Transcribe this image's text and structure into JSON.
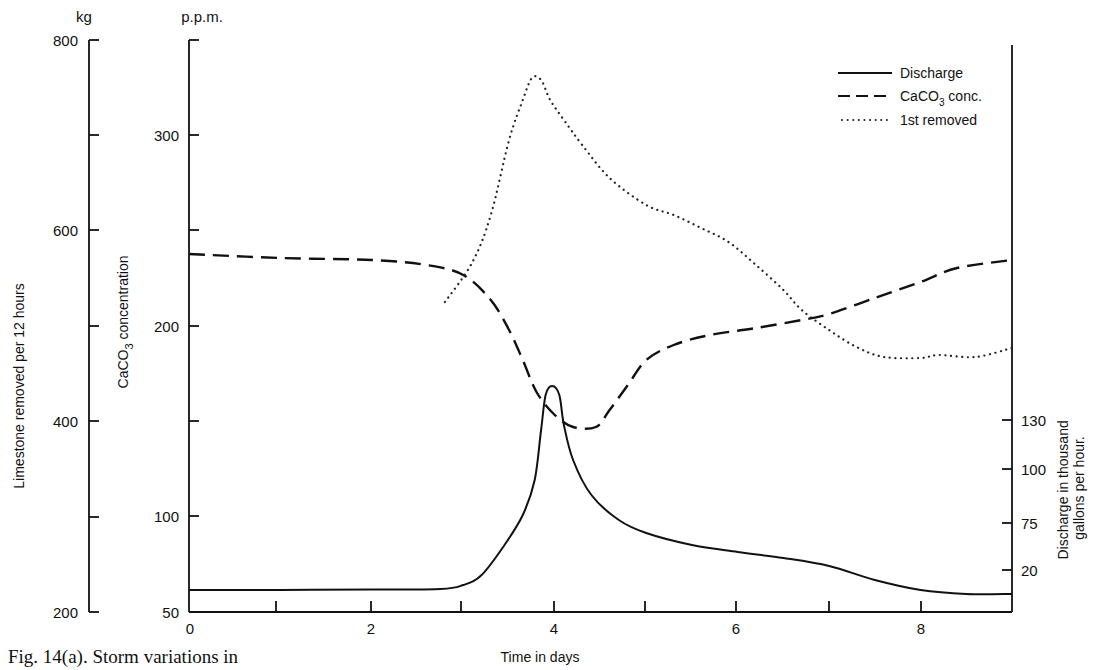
{
  "caption": "Fig. 14(a). Storm variations in",
  "chart_data": {
    "type": "line",
    "title": "",
    "xlabel": "Time in days",
    "x_ticks": [
      0,
      2,
      4,
      6,
      8
    ],
    "x_minor_ticks": [
      1,
      3,
      5,
      7
    ],
    "xlim": [
      0,
      9
    ],
    "axes": {
      "kg": {
        "unit_label": "kg",
        "label": "Limestone removed per 12 hours",
        "ticks": [
          800,
          700,
          600,
          500,
          400,
          300,
          200
        ],
        "tick_labels": [
          "800",
          "",
          "600",
          "",
          "400",
          "",
          "200"
        ],
        "range": [
          200,
          800
        ]
      },
      "ppm": {
        "unit_label": "p.p.m.",
        "label": "CaCO3 concentration",
        "ticks": [
          "top",
          300,
          250,
          200,
          150,
          100,
          50
        ],
        "tick_labels": [
          "",
          "300",
          "",
          "200",
          "",
          "100",
          "50"
        ],
        "range": [
          50,
          350
        ]
      },
      "discharge": {
        "label": "Discharge in thousand gallons per hour.",
        "tick_labels": [
          "130",
          "100",
          "75",
          "20"
        ]
      }
    },
    "legend": [
      {
        "name": "Discharge",
        "style": "solid"
      },
      {
        "name": "CaCO3 conc.",
        "style": "dashed"
      },
      {
        "name": "1st removed",
        "style": "dotted"
      }
    ],
    "legend_position": "top-right",
    "grid": false,
    "series": [
      {
        "name": "Discharge",
        "axis": "discharge",
        "style": "solid",
        "points": [
          [
            0,
            590
          ],
          [
            1,
            590
          ],
          [
            2,
            589.5
          ],
          [
            2.75,
            589
          ],
          [
            3.0,
            585
          ],
          [
            3.2,
            575
          ],
          [
            3.45,
            545
          ],
          [
            3.65,
            515
          ],
          [
            3.78,
            480
          ],
          [
            3.85,
            430
          ],
          [
            3.9,
            395
          ],
          [
            3.97,
            386
          ],
          [
            4.05,
            395
          ],
          [
            4.1,
            425
          ],
          [
            4.2,
            460
          ],
          [
            4.4,
            495
          ],
          [
            4.7,
            520
          ],
          [
            5.0,
            533
          ],
          [
            5.5,
            545
          ],
          [
            6.0,
            552
          ],
          [
            6.5,
            558
          ],
          [
            7.0,
            566
          ],
          [
            7.5,
            580
          ],
          [
            8.0,
            590
          ],
          [
            8.5,
            594
          ],
          [
            9.0,
            594
          ]
        ]
      },
      {
        "name": "CaCO3 conc.",
        "axis": "ppm",
        "style": "dashed",
        "points": [
          [
            0,
            254
          ],
          [
            1,
            258
          ],
          [
            2,
            260
          ],
          [
            2.6,
            265
          ],
          [
            3.0,
            275
          ],
          [
            3.3,
            300
          ],
          [
            3.5,
            330
          ],
          [
            3.65,
            360
          ],
          [
            3.8,
            392
          ],
          [
            4.0,
            415
          ],
          [
            4.2,
            427
          ],
          [
            4.45,
            427
          ],
          [
            4.6,
            410
          ],
          [
            4.8,
            385
          ],
          [
            5.0,
            360
          ],
          [
            5.3,
            345
          ],
          [
            5.7,
            335
          ],
          [
            6.2,
            328
          ],
          [
            6.7,
            320
          ],
          [
            7.0,
            314
          ],
          [
            7.5,
            298
          ],
          [
            8.0,
            282
          ],
          [
            8.4,
            268
          ],
          [
            9.0,
            260
          ]
        ]
      },
      {
        "name": "1st removed",
        "axis": "kg",
        "style": "dotted",
        "points": [
          [
            2.8,
            302
          ],
          [
            3.1,
            262
          ],
          [
            3.3,
            215
          ],
          [
            3.5,
            140
          ],
          [
            3.65,
            100
          ],
          [
            3.75,
            78
          ],
          [
            3.85,
            80
          ],
          [
            3.95,
            100
          ],
          [
            4.1,
            120
          ],
          [
            4.3,
            145
          ],
          [
            4.6,
            178
          ],
          [
            5.0,
            205
          ],
          [
            5.3,
            215
          ],
          [
            5.6,
            228
          ],
          [
            5.9,
            242
          ],
          [
            6.2,
            265
          ],
          [
            6.5,
            290
          ],
          [
            6.7,
            310
          ],
          [
            7.0,
            330
          ],
          [
            7.3,
            347
          ],
          [
            7.6,
            357
          ],
          [
            8.0,
            358
          ],
          [
            8.2,
            355
          ],
          [
            8.6,
            357
          ],
          [
            9.0,
            348
          ]
        ]
      }
    ]
  }
}
